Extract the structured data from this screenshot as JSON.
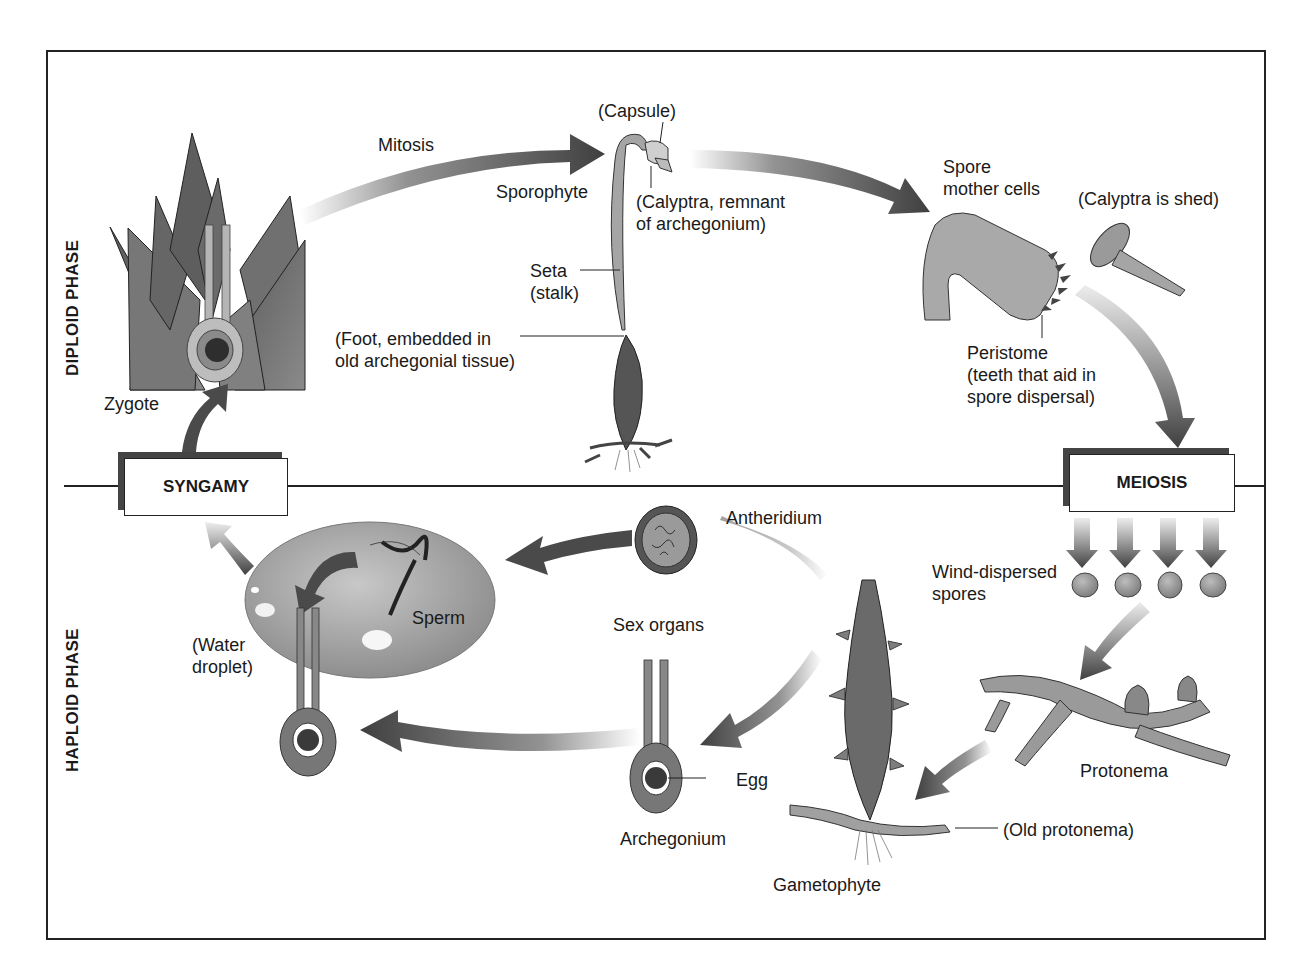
{
  "phases": {
    "diploid": "DIPLOID PHASE",
    "haploid": "HAPLOID PHASE"
  },
  "processes": {
    "syngamy": "SYNGAMY",
    "meiosis": "MEIOSIS",
    "mitosis": "Mitosis"
  },
  "labels": {
    "zygote": "Zygote",
    "capsule": "(Capsule)",
    "sporophyte": "Sporophyte",
    "calyptra_remnant": "(Calyptra, remnant\nof archegonium)",
    "seta": "Seta\n(stalk)",
    "foot": "(Foot, embedded in\nold archegonial tissue)",
    "spore_mother_cells": "Spore\nmother cells",
    "calyptra_shed": "(Calyptra is shed)",
    "peristome": "Peristome\n(teeth that aid in\nspore dispersal)",
    "wind_dispersed_spores": "Wind-dispersed\nspores",
    "protonema": "Protonema",
    "old_protonema": "(Old protonema)",
    "gametophyte": "Gametophyte",
    "sex_organs": "Sex organs",
    "antheridium": "Antheridium",
    "archegonium": "Archegonium",
    "egg": "Egg",
    "sperm": "Sperm",
    "water_droplet": "(Water\ndroplet)"
  },
  "colors": {
    "tissue": "#6e6e6e",
    "tissue_light": "#a8a8a8",
    "arrow": "#4a4a4a",
    "frame": "#222222"
  }
}
